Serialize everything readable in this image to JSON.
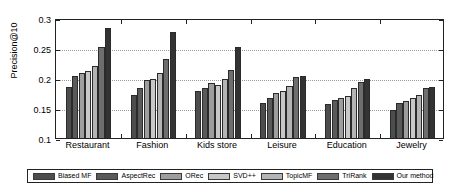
{
  "chart_data": {
    "type": "bar",
    "title": "",
    "xlabel": "",
    "ylabel": "Precision@10",
    "ylim": [
      0.1,
      0.3
    ],
    "yticks": [
      "0.1",
      "0.15",
      "0.2",
      "0.25",
      "0.3"
    ],
    "ytick_values": [
      0.1,
      0.15,
      0.2,
      0.25,
      0.3
    ],
    "grid": true,
    "legend_position": "bottom",
    "categories": [
      "Restaurant",
      "Fashion",
      "Kids store",
      "Leisure",
      "Education",
      "Jewelry"
    ],
    "series": [
      {
        "name": "Biased MF",
        "color": "#4d4d4d",
        "values": [
          0.185,
          0.172,
          0.178,
          0.159,
          0.156,
          0.146
        ]
      },
      {
        "name": "AspectRec",
        "color": "#5a5a5a",
        "values": [
          0.204,
          0.183,
          0.183,
          0.166,
          0.163,
          0.158
        ]
      },
      {
        "name": "ORec",
        "color": "#9e9e9e",
        "values": [
          0.208,
          0.196,
          0.192,
          0.175,
          0.166,
          0.162
        ]
      },
      {
        "name": "SVD++",
        "color": "#c8c8c8",
        "values": [
          0.212,
          0.199,
          0.188,
          0.179,
          0.17,
          0.167
        ]
      },
      {
        "name": "TopicMF",
        "color": "#b4b4b4",
        "values": [
          0.22,
          0.208,
          0.199,
          0.187,
          0.184,
          0.172
        ]
      },
      {
        "name": "TriRank",
        "color": "#6e6e6e",
        "values": [
          0.252,
          0.232,
          0.214,
          0.202,
          0.194,
          0.183
        ]
      },
      {
        "name": "Our method",
        "color": "#333333",
        "values": [
          0.283,
          0.277,
          0.252,
          0.203,
          0.198,
          0.185
        ]
      }
    ]
  },
  "axes": {
    "y_axis_title": "Precision@10"
  }
}
